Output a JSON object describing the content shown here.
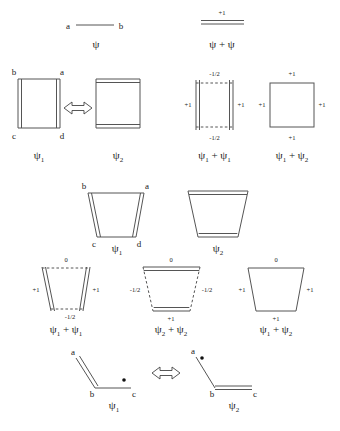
{
  "figure": {
    "title_text": "",
    "colors": {
      "line": "#555555",
      "text": "#1a1a1a",
      "background": "#ffffff",
      "dot": "#111111"
    },
    "rows": [
      {
        "row_id": "row-1-edge",
        "items": [
          {
            "item_id": "single-edge",
            "caption": "ψ",
            "node_labels": {
              "left": "a",
              "right": "b"
            },
            "weights": []
          },
          {
            "item_id": "double-edge",
            "caption": "ψ + ψ",
            "node_labels": {},
            "weights": [
              "+1"
            ]
          }
        ]
      },
      {
        "row_id": "row-2-squares",
        "items": [
          {
            "item_id": "square-psi1",
            "caption": "ψ",
            "caption_sub": "1",
            "node_labels": {
              "tl": "b",
              "tr": "a",
              "bl": "c",
              "br": "d"
            },
            "weights": []
          },
          {
            "item_id": "square-psi2",
            "caption": "ψ",
            "caption_sub": "2",
            "node_labels": {},
            "weights": []
          },
          {
            "item_id": "square-psi1-psi1",
            "caption": "ψ₁ + ψ₁",
            "caption_parts": [
              "ψ",
              "1",
              " + ",
              "ψ",
              "1"
            ],
            "node_labels": {},
            "weights": {
              "top": "-1/2",
              "bottom": "-1/2",
              "left": "+1",
              "right": "+1"
            }
          },
          {
            "item_id": "square-psi1-psi2",
            "caption": "ψ₁ + ψ₂",
            "caption_parts": [
              "ψ",
              "1",
              " + ",
              "ψ",
              "2"
            ],
            "node_labels": {},
            "weights": {
              "top": "+1",
              "bottom": "+1",
              "left": "+1",
              "right": "+1"
            }
          }
        ]
      },
      {
        "row_id": "row-3-trapezoids",
        "items": [
          {
            "item_id": "trap-psi1",
            "caption": "ψ",
            "caption_sub": "1",
            "node_labels": {
              "tl": "b",
              "tr": "a",
              "bl": "c",
              "br": "d"
            },
            "weights": []
          },
          {
            "item_id": "trap-psi2",
            "caption": "ψ",
            "caption_sub": "2",
            "node_labels": {},
            "weights": []
          }
        ]
      },
      {
        "row_id": "row-4-trapezoid-sums",
        "items": [
          {
            "item_id": "trap-psi1-psi1",
            "caption_parts": [
              "ψ",
              "1",
              " + ",
              "ψ",
              "1"
            ],
            "weights": {
              "top": "0",
              "bottom": "-1/2",
              "left": "+1",
              "right": "+1"
            }
          },
          {
            "item_id": "trap-psi2-psi2",
            "caption_parts": [
              "ψ",
              "2",
              " + ",
              "ψ",
              "2"
            ],
            "weights": {
              "top": "0",
              "bottom": "+1",
              "left": "-1/2",
              "right": "-1/2"
            }
          },
          {
            "item_id": "trap-psi1-psi2",
            "caption_parts": [
              "ψ",
              "1",
              " + ",
              "ψ",
              "2"
            ],
            "weights": {
              "top": "0",
              "bottom": "+1",
              "left": "+1",
              "right": "+1"
            }
          }
        ]
      },
      {
        "row_id": "row-5-paths",
        "items": [
          {
            "item_id": "path-psi1",
            "caption": "ψ",
            "caption_sub": "1",
            "node_labels": {
              "a": "a",
              "b": "b",
              "c": "c"
            },
            "weights": []
          },
          {
            "item_id": "path-psi2",
            "caption": "ψ",
            "caption_sub": "2",
            "node_labels": {
              "a": "a",
              "b": "b",
              "c": "c"
            },
            "weights": []
          }
        ]
      }
    ],
    "arrows": [
      {
        "arrow_id": "arrow-row2",
        "glyph": "⟺"
      },
      {
        "arrow_id": "arrow-row5",
        "glyph": "⟺"
      }
    ]
  }
}
